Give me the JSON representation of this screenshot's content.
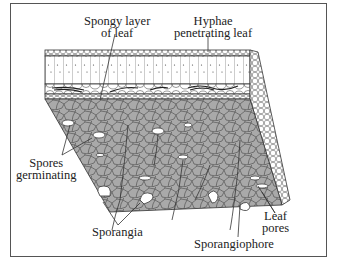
{
  "figure": {
    "type": "leaf cross-section illustration",
    "colors": {
      "frame": "#555555",
      "line": "#333333",
      "underside_fill": "#a9a9a9",
      "background": "#ffffff"
    },
    "labels": {
      "spongy_layer": [
        "Spongy layer",
        "of leaf"
      ],
      "hyphae": [
        "Hyphae",
        "penetrating leaf"
      ],
      "spores": [
        "Spores",
        "germinating"
      ],
      "sporangia": "Sporangia",
      "sporangiophore": "Sporangiophore",
      "leaf_pores": [
        "Leaf",
        "pores"
      ]
    }
  }
}
